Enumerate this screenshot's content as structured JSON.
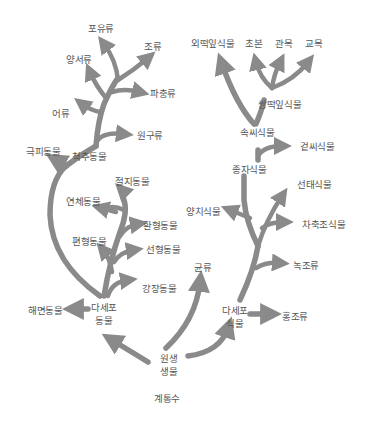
{
  "title": "계통수",
  "colors": {
    "branch": "#8a8a8a",
    "text": "#555555",
    "background": "#ffffff"
  },
  "root": {
    "label_line1": "원생",
    "label_line2": "생물"
  },
  "animals": {
    "multicellular": {
      "line1": "다세포",
      "line2": "동물"
    },
    "sponge": "해면동물",
    "cnidarian": "강장동물",
    "nematode": "선형동물",
    "flatworm": "편형동물",
    "annelid": "환형동물",
    "mollusc": "연체동물",
    "arthropod": "절지동물",
    "echinoderm": "극피동물",
    "vertebrate": "척추동물",
    "protochordate": "원구류",
    "fish": "어류",
    "amphibian": "양서류",
    "reptile": "파충류",
    "bird": "조류",
    "mammal": "포유류"
  },
  "fungi": {
    "label": "균류"
  },
  "plants": {
    "multicellular": {
      "line1": "다세포",
      "line2": "식물"
    },
    "red_algae": "홍조류",
    "green_algae": "녹조류",
    "charophyte": "차축조식물",
    "bryophyte": "선태식물",
    "fern": "양치식물",
    "seed_plant": "종자식물",
    "gymnosperm": "겉씨식물",
    "angiosperm": "속씨식물",
    "monocot": "외떡잎식물",
    "dicot": "쌍떡잎식물",
    "herb": "초본",
    "shrub": "관목",
    "tree": "교목"
  }
}
